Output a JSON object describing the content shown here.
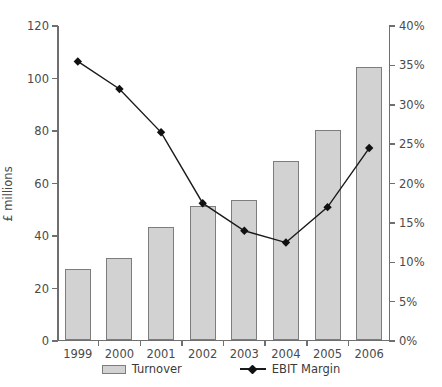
{
  "chart_data": {
    "type": "bar",
    "title": "",
    "categories": [
      "1999",
      "2000",
      "2001",
      "2002",
      "2003",
      "2004",
      "2005",
      "2006"
    ],
    "series": [
      {
        "name": "Turnover",
        "type": "bar",
        "axis": "left",
        "values": [
          27,
          31,
          43,
          51,
          53,
          68,
          80,
          104
        ]
      },
      {
        "name": "EBIT Margin",
        "type": "line",
        "axis": "right",
        "values": [
          35.5,
          32.0,
          26.5,
          17.5,
          14.0,
          12.5,
          17.0,
          24.5
        ]
      }
    ],
    "xlabel": "",
    "ylabel": "£ millions",
    "ylabel_right": "",
    "ylim": [
      0,
      120
    ],
    "ylim_right": [
      0,
      40
    ],
    "yticks": [
      0,
      20,
      40,
      60,
      80,
      100,
      120
    ],
    "yticklabels": [
      "0",
      "20",
      "40",
      "60",
      "80",
      "100",
      "120"
    ],
    "yticks_right": [
      0,
      5,
      10,
      15,
      20,
      25,
      30,
      35,
      40
    ],
    "yticklabels_right": [
      "0%",
      "5%",
      "10%",
      "15%",
      "20%",
      "25%",
      "30%",
      "35%",
      "40%"
    ],
    "grid": false,
    "legend_position": "bottom",
    "legend": [
      "Turnover",
      "EBIT Margin"
    ],
    "colors": {
      "bar_fill": "#d2d2d2",
      "bar_border": "#7d7d7d",
      "line": "#1a1a1a",
      "marker": "#111111",
      "axis": "#6f6f6f",
      "text": "#3a3a3a"
    }
  }
}
